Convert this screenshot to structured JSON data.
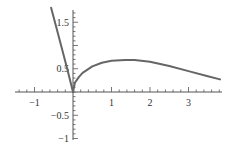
{
  "chart_data": {
    "type": "line",
    "title": "",
    "xlabel": "",
    "ylabel": "",
    "xlim": [
      -1.5,
      3.9
    ],
    "ylim": [
      -1.1,
      1.8
    ],
    "grid": false,
    "x_ticks": [
      {
        "value": -1,
        "label": "−1"
      },
      {
        "value": 1,
        "label": "1"
      },
      {
        "value": 2,
        "label": "2"
      },
      {
        "value": 3,
        "label": "3"
      }
    ],
    "y_ticks": [
      {
        "value": 1.5,
        "label": "1.5"
      },
      {
        "value": 0.5,
        "label": "0.5"
      },
      {
        "value": -0.5,
        "label": "−0.5"
      },
      {
        "value": -1,
        "label": "−1"
      }
    ],
    "x_minor_step": 0.2,
    "y_minor_step": 0.1,
    "series": [
      {
        "name": "left-branch",
        "color": "#666666",
        "x": [
          -0.57,
          -0.45,
          -0.3,
          -0.15,
          0
        ],
        "y": [
          1.81,
          1.44,
          0.97,
          0.5,
          0
        ]
      },
      {
        "name": "right-branch",
        "color": "#666666",
        "x": [
          0,
          0.05,
          0.15,
          0.25,
          0.5,
          0.75,
          1.0,
          1.35,
          1.6,
          2.0,
          2.5,
          3.0,
          3.5,
          3.82
        ],
        "y": [
          0,
          0.2,
          0.32,
          0.41,
          0.55,
          0.63,
          0.67,
          0.69,
          0.685,
          0.65,
          0.56,
          0.45,
          0.34,
          0.27
        ]
      }
    ]
  }
}
